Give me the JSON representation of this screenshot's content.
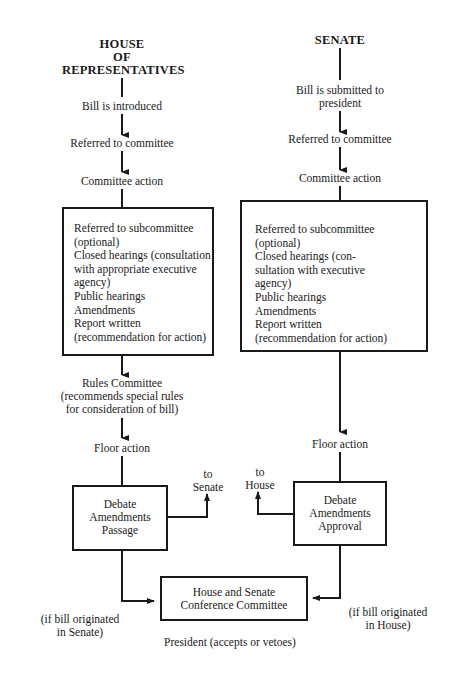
{
  "house": {
    "title_lines": [
      "HOUSE",
      "OF",
      "REPRESENTATIVES"
    ],
    "steps": [
      "Bill is introduced",
      "Referred to committee",
      "Committee action"
    ],
    "committee_box": [
      "Referred to subcommittee",
      "(optional)",
      "Closed hearings (consultation",
      "with appropriate executive",
      "agency)",
      "Public hearings",
      "Amendments",
      "Report written",
      "(recommendation for action)"
    ],
    "rules_committee": [
      "Rules Committee",
      "(recommends special rules",
      "for consideration of bill)"
    ],
    "floor_action": "Floor action",
    "debate_box": [
      "Debate",
      "Amendments",
      "Passage"
    ],
    "to_other": [
      "to",
      "Senate"
    ],
    "origin_note": [
      "(if bill originated",
      "in Senate)"
    ]
  },
  "senate": {
    "title": "SENATE",
    "steps": [
      "Bill is submitted to",
      "president",
      "Referred to committee",
      "Committee action"
    ],
    "committee_box": [
      "Referred to subcommittee",
      "(optional)",
      "Closed hearings (con-",
      "sultation with executive",
      "agency)",
      "Public hearings",
      "Amendments",
      "Report written",
      "(recommendation for action)"
    ],
    "floor_action": "Floor action",
    "debate_box": [
      "Debate",
      "Amendments",
      "Approval"
    ],
    "to_other": [
      "to",
      "House"
    ],
    "origin_note": [
      "(if bill originated",
      "in House)"
    ]
  },
  "conference": [
    "House and Senate",
    "Conference Committee"
  ],
  "final": "President (accepts or vetoes)"
}
